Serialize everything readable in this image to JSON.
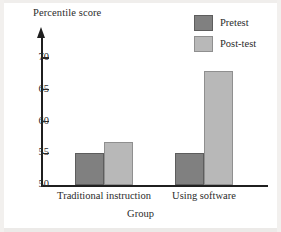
{
  "chart_data": {
    "type": "bar",
    "title": "",
    "categories": [
      "Traditional instruction",
      "Using software"
    ],
    "series": [
      {
        "name": "Pretest",
        "color": "#808080",
        "values": [
          55,
          55
        ]
      },
      {
        "name": "Post-test",
        "color": "#b8b8b8",
        "values": [
          56.8,
          68
        ]
      }
    ],
    "xlabel": "Group",
    "ylabel": "Percentile score",
    "ylim": [
      50,
      72
    ],
    "yticks": [
      50,
      55,
      60,
      65,
      70
    ],
    "ytick_labels": [
      "50",
      "55",
      "60",
      "65",
      "70"
    ],
    "grid": false,
    "legend_position": "top-right",
    "y_axis_arrow": true,
    "baseline_value": 50
  },
  "axes": {
    "y_title": "Percentile score",
    "x_title": "Group"
  },
  "legend": {
    "items": [
      {
        "label": "Pretest",
        "swatch": "#808080"
      },
      {
        "label": "Post-test",
        "swatch": "#b8b8b8"
      }
    ]
  }
}
